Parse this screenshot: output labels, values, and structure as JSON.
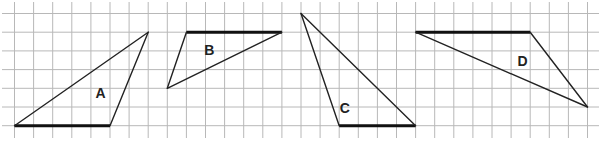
{
  "diagram": {
    "type": "grid-triangles",
    "grid": {
      "columns": 31,
      "rows": 7
    },
    "triangles": [
      {
        "label": "A",
        "vertices": [
          [
            0,
            6
          ],
          [
            5,
            6
          ],
          [
            7,
            1
          ]
        ],
        "bold_edge": [
          0,
          1
        ],
        "label_at": [
          4.5,
          4.3
        ]
      },
      {
        "label": "B",
        "vertices": [
          [
            9,
            1
          ],
          [
            14,
            1
          ],
          [
            8,
            4
          ]
        ],
        "bold_edge": [
          0,
          1
        ],
        "label_at": [
          10.2,
          2.0
        ]
      },
      {
        "label": "C",
        "vertices": [
          [
            15,
            0
          ],
          [
            17,
            6
          ],
          [
            21,
            6
          ]
        ],
        "bold_edge": [
          1,
          2
        ],
        "label_at": [
          17.3,
          5.1
        ]
      },
      {
        "label": "D",
        "vertices": [
          [
            21,
            1
          ],
          [
            27,
            1
          ],
          [
            30,
            5
          ]
        ],
        "bold_edge": [
          0,
          1
        ],
        "label_at": [
          26.6,
          2.6
        ]
      }
    ]
  }
}
